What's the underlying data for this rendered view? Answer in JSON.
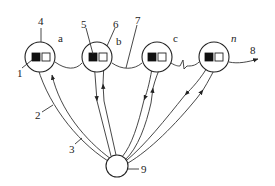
{
  "diagram": {
    "type": "network-schematic",
    "nodes": [
      {
        "id": "a",
        "label": "a",
        "cx": 40,
        "cy": 57
      },
      {
        "id": "b",
        "label": "b",
        "cx": 97,
        "cy": 57
      },
      {
        "id": "c",
        "label": "c",
        "cx": 157,
        "cy": 57
      },
      {
        "id": "n",
        "label": "n",
        "cx": 214,
        "cy": 57
      }
    ],
    "hub": {
      "id": "9",
      "label": "9",
      "cx": 117,
      "cy": 166
    },
    "callouts": {
      "c1": "1",
      "c2": "2",
      "c3": "3",
      "c4": "4",
      "c5": "5",
      "c6": "6",
      "c7": "7",
      "c8": "8",
      "c9": "9"
    },
    "node_labels": {
      "a": "a",
      "b": "b",
      "c": "c",
      "n": "n"
    },
    "colors": {
      "line": "#333333",
      "fill_square": "#111111",
      "background": "#ffffff"
    }
  }
}
